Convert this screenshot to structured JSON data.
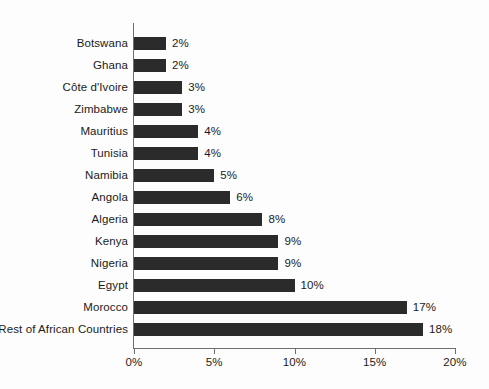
{
  "chart_data": {
    "type": "bar",
    "orientation": "horizontal",
    "title": "",
    "subtitle": "",
    "xlabel": "",
    "ylabel": "",
    "xlim": [
      0,
      20
    ],
    "grid": false,
    "legend": false,
    "value_suffix": "%",
    "series_name": "Share",
    "bar_color": "#2b2b2b",
    "axis_color": "#6e6e6e",
    "background_color": "#fdfdfd",
    "text_color": "#1b1b1b",
    "categories": [
      "Botswana",
      "Ghana",
      "Côte d'Ivoire",
      "Zimbabwe",
      "Mauritius",
      "Tunisia",
      "Namibia",
      "Angola",
      "Algeria",
      "Kenya",
      "Nigeria",
      "Egypt",
      "Morocco",
      "Rest of African Countries"
    ],
    "values": [
      2,
      2,
      3,
      3,
      4,
      4,
      5,
      6,
      8,
      9,
      9,
      10,
      17,
      18
    ],
    "data_labels": [
      "2%",
      "2%",
      "3%",
      "3%",
      "4%",
      "4%",
      "5%",
      "6%",
      "8%",
      "9%",
      "9%",
      "10%",
      "17%",
      "18%"
    ],
    "xticks": [
      0,
      5,
      10,
      15,
      20
    ],
    "xtick_labels": [
      "0%",
      "5%",
      "10%",
      "15%",
      "20%"
    ]
  }
}
